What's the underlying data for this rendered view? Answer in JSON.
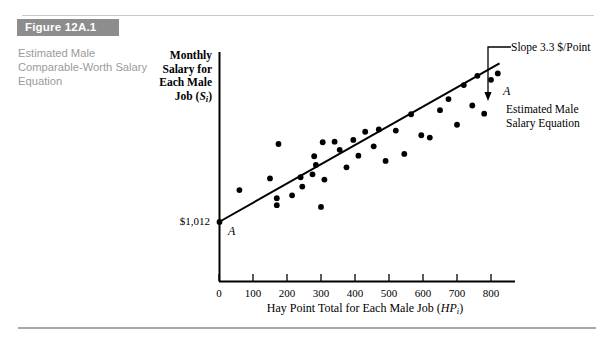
{
  "figure": {
    "banner_label": "Figure 12A.1",
    "caption": "Estimated Male Comparable-Worth Salary Equation"
  },
  "chart_data": {
    "type": "scatter",
    "title": "",
    "xlabel": "Hay Point Total for Each Male Job (HPᵢ)",
    "ylabel": "Monthly Salary for Each Male Job (Sᵢ)",
    "xlabel_main": "Hay Point Total for Each Male Job (",
    "xlabel_sym": "HP",
    "xlabel_sub": "i",
    "xlabel_close": ")",
    "ylabel_lines": [
      "Monthly",
      "Salary for",
      "Each Male",
      "Job ("
    ],
    "ylabel_sym": "S",
    "ylabel_sub": "i",
    "ylabel_close": ")",
    "xlim": [
      0,
      870
    ],
    "ylim": [
      0,
      4200
    ],
    "xticks": [
      0,
      100,
      200,
      300,
      400,
      500,
      600,
      700,
      800
    ],
    "xtick_labels": [
      "0",
      "100",
      "200",
      "300",
      "400",
      "500",
      "600",
      "700",
      "800"
    ],
    "yticks": [],
    "grid": false,
    "legend": "none",
    "intercept_label": "$1,012",
    "intercept_value": 1012,
    "line_label_low": "A",
    "line_label_high": "A",
    "slope_annotation": "Slope 3.3 $/Point",
    "slope_value": 3.3,
    "slope_units": "$/Point",
    "series_annotation_lines": [
      "Estimated Male",
      "Salary Equation"
    ],
    "regression_line": {
      "x0": 0,
      "y0": 1012,
      "x1": 825,
      "y1": 3734
    },
    "points": [
      {
        "x": 60,
        "y": 1560
      },
      {
        "x": 150,
        "y": 1760
      },
      {
        "x": 170,
        "y": 1420
      },
      {
        "x": 170,
        "y": 1300
      },
      {
        "x": 175,
        "y": 2350
      },
      {
        "x": 215,
        "y": 1470
      },
      {
        "x": 240,
        "y": 1780
      },
      {
        "x": 245,
        "y": 1620
      },
      {
        "x": 275,
        "y": 1830
      },
      {
        "x": 280,
        "y": 2140
      },
      {
        "x": 285,
        "y": 1990
      },
      {
        "x": 300,
        "y": 1270
      },
      {
        "x": 305,
        "y": 2380
      },
      {
        "x": 310,
        "y": 1740
      },
      {
        "x": 340,
        "y": 2390
      },
      {
        "x": 355,
        "y": 2250
      },
      {
        "x": 375,
        "y": 1950
      },
      {
        "x": 395,
        "y": 2420
      },
      {
        "x": 410,
        "y": 2150
      },
      {
        "x": 430,
        "y": 2560
      },
      {
        "x": 455,
        "y": 2310
      },
      {
        "x": 470,
        "y": 2600
      },
      {
        "x": 490,
        "y": 2060
      },
      {
        "x": 520,
        "y": 2580
      },
      {
        "x": 545,
        "y": 2180
      },
      {
        "x": 565,
        "y": 2860
      },
      {
        "x": 595,
        "y": 2500
      },
      {
        "x": 620,
        "y": 2460
      },
      {
        "x": 650,
        "y": 2930
      },
      {
        "x": 675,
        "y": 3120
      },
      {
        "x": 700,
        "y": 2680
      },
      {
        "x": 720,
        "y": 3360
      },
      {
        "x": 745,
        "y": 3010
      },
      {
        "x": 760,
        "y": 3520
      },
      {
        "x": 780,
        "y": 2870
      },
      {
        "x": 800,
        "y": 3450
      },
      {
        "x": 820,
        "y": 3560
      }
    ]
  },
  "axes_geometry": {
    "origin_px": {
      "x": 219,
      "y": 281
    },
    "x_axis_end_px": 515,
    "y_axis_top_px": 52,
    "px_per_100_hay": 34,
    "intercept_px_y": 222
  }
}
